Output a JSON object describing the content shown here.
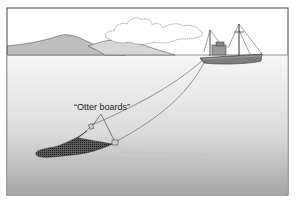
{
  "diagram": {
    "callout_label": "“Otter boards”",
    "colors": {
      "sky": "#ffffff",
      "water_top": "#f4f4f4",
      "water_bottom": "#a9a9a9",
      "hill_dark": "#bdbdbd",
      "hill_light": "#d6d6d6",
      "outline": "#333333",
      "net": "#3a3a3a"
    }
  }
}
